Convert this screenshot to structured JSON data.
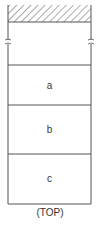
{
  "diagram": {
    "layers": [
      {
        "label": "a"
      },
      {
        "label": "b"
      },
      {
        "label": "c"
      }
    ],
    "caption": "(TOP)",
    "hatched_region": "hatched-top-band",
    "line_color": "#555555"
  }
}
